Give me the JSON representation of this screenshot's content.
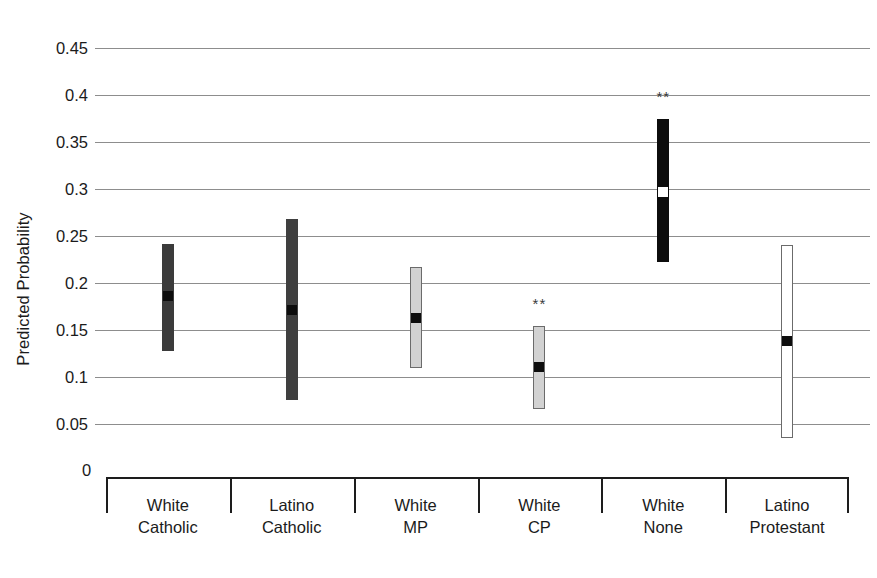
{
  "chart_data": {
    "type": "bar",
    "title": "",
    "subtitle": "",
    "xlabel": "",
    "ylabel": "Predicted Probability",
    "ylim": [
      0,
      0.45
    ],
    "ytick_labels": [
      "0.45",
      "0.4",
      "0.35",
      "0.3",
      "0.25",
      "0.2",
      "0.15",
      "0.1",
      "0.05",
      "0"
    ],
    "ytick_values": [
      0.45,
      0.4,
      0.35,
      0.3,
      0.25,
      0.2,
      0.15,
      0.1,
      0.05,
      0
    ],
    "grid": "horizontal",
    "legend": "none",
    "annotation_note": "** denotes statistical significance",
    "categories": [
      "White\nCatholic",
      "Latino\nCatholic",
      "White\nMP",
      "White\nCP",
      "White\nNone",
      "Latino\nProtestant"
    ],
    "category_labels": [
      {
        "line1": "White",
        "line2": "Catholic"
      },
      {
        "line1": "Latino",
        "line2": "Catholic"
      },
      {
        "line1": "White",
        "line2": "MP"
      },
      {
        "line1": "White",
        "line2": "CP"
      },
      {
        "line1": "White",
        "line2": "None"
      },
      {
        "line1": "Latino",
        "line2": "Protestant"
      }
    ],
    "series": [
      {
        "name": "Predicted Probability with 95% interval",
        "points": [
          {
            "category": "White Catholic",
            "estimate": 0.186,
            "low": 0.128,
            "high": 0.242,
            "fill": "#3b3b3b",
            "border": "#3b3b3b",
            "marker": "#0d0d0d",
            "significant": false,
            "sig_label": ""
          },
          {
            "category": "Latino Catholic",
            "estimate": 0.171,
            "low": 0.075,
            "high": 0.268,
            "fill": "#3f3f3f",
            "border": "#3f3f3f",
            "marker": "#0d0d0d",
            "significant": false,
            "sig_label": ""
          },
          {
            "category": "White MP",
            "estimate": 0.163,
            "low": 0.11,
            "high": 0.217,
            "fill": "#d2d2d2",
            "border": "#6b6b6b",
            "marker": "#0d0d0d",
            "significant": false,
            "sig_label": ""
          },
          {
            "category": "White CP",
            "estimate": 0.111,
            "low": 0.066,
            "high": 0.154,
            "fill": "#d2d2d2",
            "border": "#6b6b6b",
            "marker": "#0d0d0d",
            "significant": true,
            "sig_label": "**"
          },
          {
            "category": "White None",
            "estimate": 0.297,
            "low": 0.222,
            "high": 0.374,
            "fill": "#0d0d0d",
            "border": "#0d0d0d",
            "marker": "#ffffff",
            "significant": true,
            "sig_label": "**"
          },
          {
            "category": "Latino Protestant",
            "estimate": 0.138,
            "low": 0.035,
            "high": 0.24,
            "fill": "#ffffff",
            "border": "#6b6b6b",
            "marker": "#0d0d0d",
            "significant": false,
            "sig_label": ""
          }
        ]
      }
    ],
    "colors": {
      "gridline": "#8d8d8d",
      "axis": "#1d1d1d",
      "text": "#1b1b1b",
      "background": "#ffffff"
    }
  }
}
